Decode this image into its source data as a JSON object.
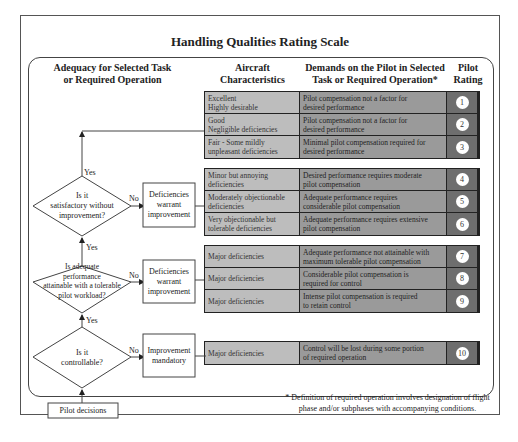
{
  "title": "Handling Qualities Rating Scale",
  "headers": {
    "adequacy_line1": "Adequacy for Selected Task",
    "adequacy_line2": "or Required Operation",
    "aircraft_line1": "Aircraft",
    "aircraft_line2": "Characteristics",
    "demands_line1": "Demands on the Pilot in Selected",
    "demands_line2": "Task or Required Operation*",
    "rating_line1": "Pilot",
    "rating_line2": "Rating"
  },
  "groups": [
    {
      "rows": [
        {
          "char1": "Excellent",
          "char2": "Highly desirable",
          "dem1": "Pilot compensation not a factor for",
          "dem2": "desired performance",
          "rating": "1"
        },
        {
          "char1": "Good",
          "char2": "Negligible deficiencies",
          "dem1": "Pilot compensation not a factor for",
          "dem2": "desired performance",
          "rating": "2"
        },
        {
          "char1": "Fair - Some mildly",
          "char2": "unpleasant deficiencies",
          "dem1": "Minimal pilot compensation required for",
          "dem2": "desired performance",
          "rating": "3"
        }
      ]
    },
    {
      "rows": [
        {
          "char1": "Minor but annoying",
          "char2": "deficiencies",
          "dem1": "Desired performance requires moderate",
          "dem2": "pilot compensation",
          "rating": "4"
        },
        {
          "char1": "Moderately objectionable",
          "char2": "deficiencies",
          "dem1": "Adequate performance requires",
          "dem2": "considerable pilot compensation",
          "rating": "5"
        },
        {
          "char1": "Very objectionable but",
          "char2": "tolerable deficiencies",
          "dem1": "Adequate performance requires extensive",
          "dem2": "pilot compensation",
          "rating": "6"
        }
      ]
    },
    {
      "rows": [
        {
          "char1": "Major deficiencies",
          "char2": "",
          "dem1": "Adequate performance not attainable with",
          "dem2": "maximum tolerable pilot compensation",
          "rating": "7"
        },
        {
          "char1": "Major deficiencies",
          "char2": "",
          "dem1": "Considerable pilot compensation is",
          "dem2": "required for control",
          "rating": "8"
        },
        {
          "char1": "Major deficiencies",
          "char2": "",
          "dem1": "Intense pilot compensation is required",
          "dem2": "to retain control",
          "rating": "9"
        }
      ]
    },
    {
      "rows": [
        {
          "char1": "Major deficiencies",
          "char2": "",
          "dem1": "Control will be lost during some portion",
          "dem2": "of required operation",
          "rating": "10"
        }
      ]
    }
  ],
  "flow": {
    "q1_l1": "Is it",
    "q1_l2": "satisfactory without",
    "q1_l3": "improvement?",
    "q2_l1": "Is adequate",
    "q2_l2": "performance",
    "q2_l3": "attainable with a tolerable",
    "q2_l4": "pilot workload?",
    "q3_l1": "Is it",
    "q3_l2": "controllable?",
    "box1_l1": "Deficiencies",
    "box1_l2": "warrant",
    "box1_l3": "improvement",
    "box2_l1": "Deficiencies",
    "box2_l2": "warrant",
    "box2_l3": "improvement",
    "box3_l1": "Improvement",
    "box3_l2": "mandatory",
    "yes": "Yes",
    "no": "No",
    "start": "Pilot decisions"
  },
  "footnote_line1": "* Definition of required operation involves designation of flight",
  "footnote_line2": "phase and/or subphases with accompanying conditions."
}
